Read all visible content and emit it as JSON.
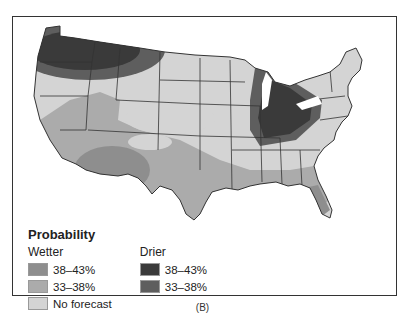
{
  "map": {
    "subject": "Precipitation outlook probability, contiguous United States",
    "regions": [
      {
        "area": "Pacific Northwest / northern Rockies (WA, OR, ID, MT)",
        "category": "drier_38_43"
      },
      {
        "area": "Pacific Northwest fringe",
        "category": "drier_33_38"
      },
      {
        "area": "Ohio Valley / Michigan / Indiana / Ohio / Kentucky",
        "category": "drier_38_43"
      },
      {
        "area": "Great Lakes / Ohio Valley fringe",
        "category": "drier_33_38"
      },
      {
        "area": "Southwest (AZ, NM)",
        "category": "wetter_38_43"
      },
      {
        "area": "Southwest / Great Basin / Southern Plains",
        "category": "wetter_33_38"
      },
      {
        "area": "Gulf Coast / Florida",
        "category": "wetter_33_38"
      },
      {
        "area": "Florida peninsula",
        "category": "wetter_38_43"
      },
      {
        "area": "Rest of country",
        "category": "no_forecast"
      }
    ]
  },
  "legend": {
    "title": "Probability",
    "wetter": {
      "label": "Wetter",
      "items": [
        {
          "label": "38–43%",
          "color": "#8e8e8e"
        },
        {
          "label": "33–38%",
          "color": "#ababab"
        }
      ]
    },
    "drier": {
      "label": "Drier",
      "items": [
        {
          "label": "38–43%",
          "color": "#3a3a3a"
        },
        {
          "label": "33–38%",
          "color": "#5e5e5e"
        }
      ]
    },
    "none": {
      "label": "No forecast",
      "color": "#d4d4d4"
    }
  },
  "caption": "(B)"
}
